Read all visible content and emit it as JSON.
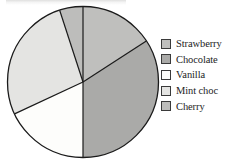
{
  "chart_data": {
    "type": "pie",
    "title": "",
    "categories": [
      "Strawberry",
      "Chocolate",
      "Vanilla",
      "Mint choc",
      "Cherry"
    ],
    "values": [
      16,
      34,
      18,
      27,
      5
    ],
    "unit": "percent",
    "legend_position": "right",
    "grid": false,
    "slice_colors": [
      "#bfbfbd",
      "#aaaaa8",
      "#fdfdfb",
      "#e4e4e2",
      "#bdbdbb"
    ],
    "outline_color": "#1a1a1a",
    "start_angle_deg": 0,
    "direction": "clockwise",
    "slices": [
      {
        "label": "Strawberry",
        "value": 16,
        "start_deg": 0,
        "end_deg": 57,
        "color": "#bfbfbd"
      },
      {
        "label": "Chocolate",
        "value": 34,
        "start_deg": 57,
        "end_deg": 180,
        "color": "#aaaaa8"
      },
      {
        "label": "Vanilla",
        "value": 18,
        "start_deg": 180,
        "end_deg": 245,
        "color": "#fdfdfb"
      },
      {
        "label": "Mint choc",
        "value": 27,
        "start_deg": 245,
        "end_deg": 342,
        "color": "#e4e4e2"
      },
      {
        "label": "Cherry",
        "value": 5,
        "start_deg": 342,
        "end_deg": 360,
        "color": "#bdbdbb"
      }
    ],
    "geometry": {
      "cx": 83,
      "cy": 82,
      "r": 75.5
    }
  },
  "legend": {
    "items": [
      {
        "label": "Strawberry",
        "color": "#bfbfbd"
      },
      {
        "label": "Chocolate",
        "color": "#aaaaa8"
      },
      {
        "label": "Vanilla",
        "color": "#fdfdfb"
      },
      {
        "label": "Mint choc",
        "color": "#e4e4e2"
      },
      {
        "label": "Cherry",
        "color": "#bdbdbb"
      }
    ]
  }
}
